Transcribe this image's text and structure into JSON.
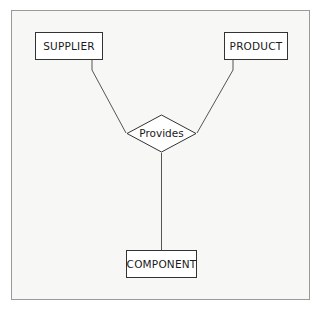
{
  "diagram": {
    "type": "entity-relationship-diagram",
    "frame": {
      "border_color": "#9a9a9a",
      "background_color": "#f7f7f5"
    },
    "entities": [
      {
        "id": "supplier",
        "label": "SUPPLIER"
      },
      {
        "id": "product",
        "label": "PRODUCT"
      },
      {
        "id": "component",
        "label": "COMPONENT"
      }
    ],
    "relationships": [
      {
        "id": "provides",
        "label": "Provides"
      }
    ],
    "connections": [
      {
        "from": "supplier",
        "to": "provides"
      },
      {
        "from": "product",
        "to": "provides"
      },
      {
        "from": "provides",
        "to": "component"
      }
    ],
    "colors": {
      "entity_border": "#333333",
      "entity_fill": "#ffffff",
      "connector_line": "#555555",
      "text": "#1a1a1a"
    }
  }
}
